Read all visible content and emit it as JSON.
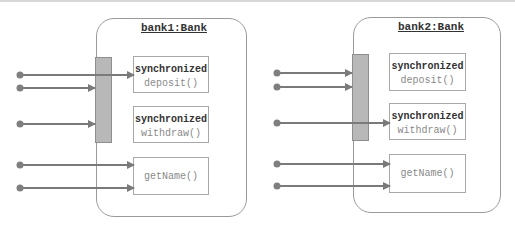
{
  "colors": {
    "arrow": "#7a7a7a",
    "lockbar": "#b8b8b8",
    "border": "#9a9a9a"
  },
  "objects": [
    {
      "title": "bank1:Bank",
      "methods": [
        {
          "keyword": "synchronized",
          "name": "deposit()"
        },
        {
          "keyword": "synchronized",
          "name": "withdraw()"
        },
        {
          "keyword": "",
          "name": "getName()"
        }
      ],
      "threads_waiting_on_lock": 2,
      "thread_inside": "deposit()"
    },
    {
      "title": "bank2:Bank",
      "methods": [
        {
          "keyword": "synchronized",
          "name": "deposit()"
        },
        {
          "keyword": "synchronized",
          "name": "withdraw()"
        },
        {
          "keyword": "",
          "name": "getName()"
        }
      ],
      "threads_waiting_on_lock": 2,
      "thread_inside": "withdraw()"
    }
  ]
}
